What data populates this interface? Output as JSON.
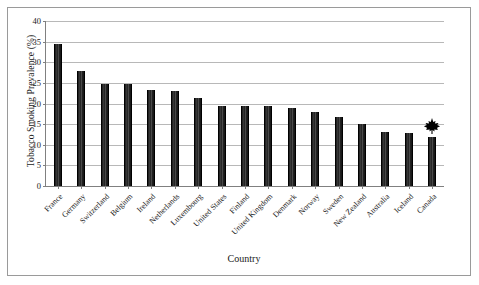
{
  "chart_data": {
    "type": "bar",
    "title": "",
    "xlabel": "Country",
    "ylabel": "Tobacco Smoking Prevalence (%)",
    "ylim": [
      0,
      40
    ],
    "yticks": [
      0,
      5,
      10,
      15,
      20,
      25,
      30,
      35,
      40
    ],
    "grid": "horizontal",
    "legend": "none",
    "bar_color": "#262626",
    "categories": [
      "France",
      "Germany",
      "Switzerland",
      "Belgium",
      "Ireland",
      "Netherlands",
      "Luxembourg",
      "United States",
      "Finland",
      "United Kingdom",
      "Denmark",
      "Norway",
      "Sweden",
      "New Zealand",
      "Australia",
      "Iceland",
      "Canada"
    ],
    "values": [
      34.5,
      27.8,
      24.8,
      24.8,
      23.3,
      23.0,
      21.3,
      19.5,
      19.4,
      19.3,
      18.8,
      18.0,
      16.7,
      15.0,
      13.2,
      12.8,
      11.8
    ],
    "annotations": [
      {
        "name": "maple-leaf-icon",
        "category": "Canada",
        "icon": "maple-leaf",
        "color": "#000000"
      }
    ]
  },
  "axes": {
    "y_title": "Tobacco Smoking Prevalence (%)",
    "x_title": "Country"
  }
}
